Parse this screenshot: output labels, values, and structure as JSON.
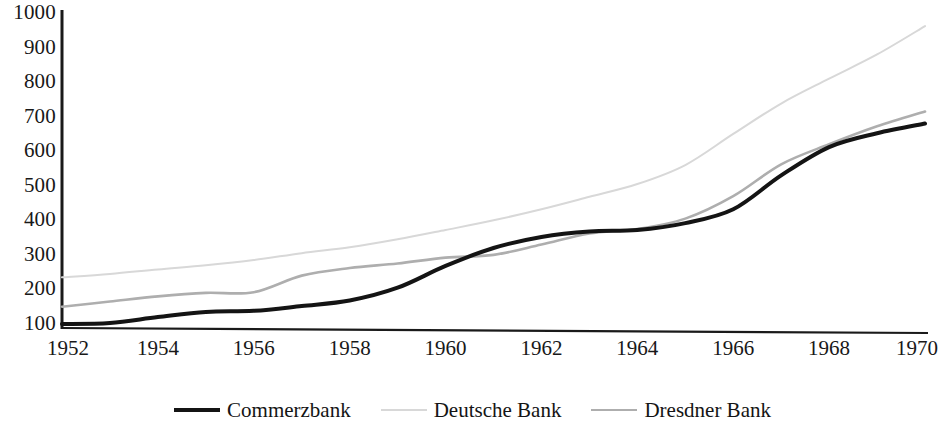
{
  "chart_data": {
    "type": "line",
    "title": "",
    "subtitle": "",
    "xlabel": "",
    "ylabel": "",
    "xlim": [
      1952,
      1970
    ],
    "ylim": [
      100,
      1000
    ],
    "grid": false,
    "legend_position": "bottom",
    "x_ticks": [
      "1952",
      "1954",
      "1956",
      "1958",
      "1960",
      "1962",
      "1964",
      "1966",
      "1968",
      "1970"
    ],
    "y_ticks": [
      "100",
      "200",
      "300",
      "400",
      "500",
      "600",
      "700",
      "800",
      "900",
      "1000"
    ],
    "x": [
      1952,
      1953,
      1954,
      1955,
      1956,
      1957,
      1958,
      1959,
      1960,
      1961,
      1962,
      1963,
      1964,
      1965,
      1966,
      1967,
      1968,
      1969,
      1970
    ],
    "series": [
      {
        "name": "Commerzbank",
        "color": "#141414",
        "width": 4.0,
        "values": [
          100,
          103,
          120,
          135,
          138,
          152,
          168,
          205,
          268,
          320,
          352,
          368,
          372,
          392,
          432,
          530,
          612,
          652,
          680
        ]
      },
      {
        "name": "Deutsche Bank",
        "color": "#d8d8d8",
        "width": 2.0,
        "values": [
          235,
          245,
          258,
          270,
          285,
          305,
          322,
          345,
          372,
          400,
          432,
          468,
          505,
          560,
          650,
          738,
          810,
          880,
          962
        ]
      },
      {
        "name": "Dresdner Bank",
        "color": "#aeaeae",
        "width": 2.6,
        "values": [
          150,
          165,
          180,
          190,
          192,
          240,
          262,
          275,
          292,
          300,
          330,
          362,
          375,
          405,
          470,
          562,
          620,
          672,
          715
        ]
      }
    ]
  },
  "axis": {
    "y_axis_name": "value-axis",
    "x_axis_name": "year-axis"
  },
  "legend": {
    "items": [
      {
        "label": "Commerzbank"
      },
      {
        "label": "Deutsche Bank"
      },
      {
        "label": "Dresdner Bank"
      }
    ]
  }
}
